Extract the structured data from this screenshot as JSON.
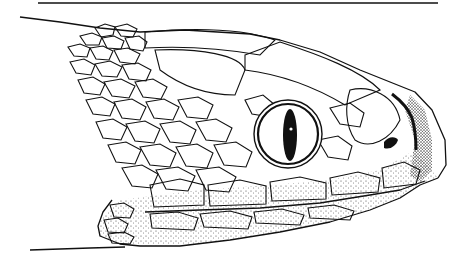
{
  "figure": {
    "style": "black ink line drawing with stippling",
    "colors": {
      "ink": "#111111",
      "paper": "#ffffff"
    }
  }
}
